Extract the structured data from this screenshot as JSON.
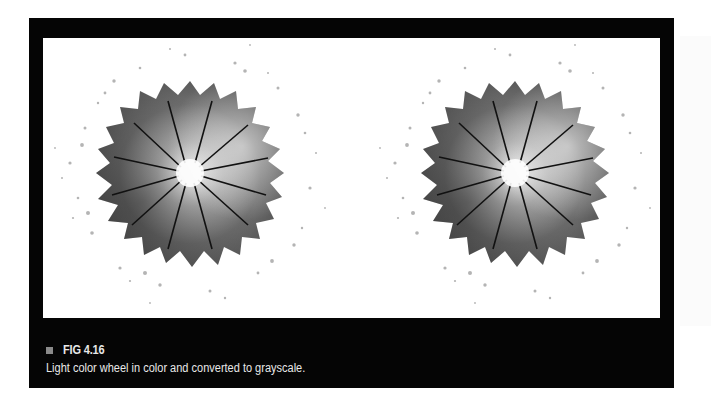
{
  "figure": {
    "number_label": "FIG 4.16",
    "caption": "Light color wheel in color and converted to grayscale.",
    "panels": [
      {
        "name": "color-wheel-original",
        "cx": 161,
        "cy": 137,
        "segments": 12
      },
      {
        "name": "color-wheel-grayscale",
        "cx": 486,
        "cy": 137,
        "segments": 12
      }
    ]
  },
  "colors": {
    "frame": "#050505",
    "caption_text": "#e8e8e8",
    "marker_square": "#8a8a8a"
  }
}
